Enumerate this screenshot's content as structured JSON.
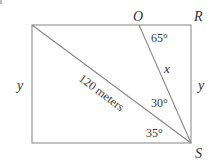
{
  "diagram": {
    "type": "geometry",
    "points": {
      "O": "O",
      "R": "R",
      "S": "S"
    },
    "side_labels": {
      "left": "y",
      "right": "y",
      "segment_OS": "x",
      "diagonal": "120 meters"
    },
    "angles": {
      "at_O": "65°",
      "between_OS_and_diagonal": "30°",
      "between_diagonal_and_bottom": "35°"
    },
    "colors": {
      "line": "#999999",
      "text": "#333333"
    }
  }
}
